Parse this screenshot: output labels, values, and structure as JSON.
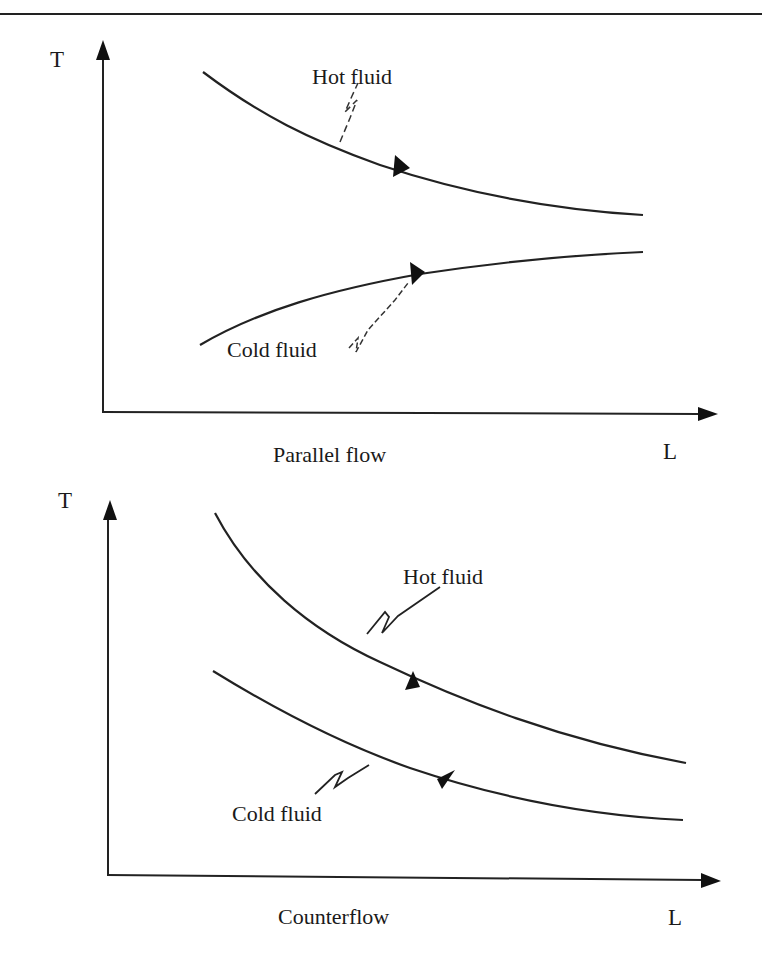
{
  "page": {
    "background": "#ffffff",
    "ink_color": "#1a1a1a"
  },
  "panels": [
    {
      "id": "parallel-flow",
      "caption": "Parallel flow",
      "y_axis_label": "T",
      "x_axis_label": "L",
      "curves": [
        {
          "name": "hot",
          "label": "Hot fluid",
          "trend": "decreasing",
          "arrow_direction": "right"
        },
        {
          "name": "cold",
          "label": "Cold fluid",
          "trend": "increasing",
          "arrow_direction": "right"
        }
      ]
    },
    {
      "id": "counterflow",
      "caption": "Counterflow",
      "y_axis_label": "T",
      "x_axis_label": "L",
      "curves": [
        {
          "name": "hot",
          "label": "Hot fluid",
          "trend": "decreasing",
          "arrow_direction": "right"
        },
        {
          "name": "cold",
          "label": "Cold fluid",
          "trend": "decreasing",
          "arrow_direction": "left"
        }
      ]
    }
  ]
}
